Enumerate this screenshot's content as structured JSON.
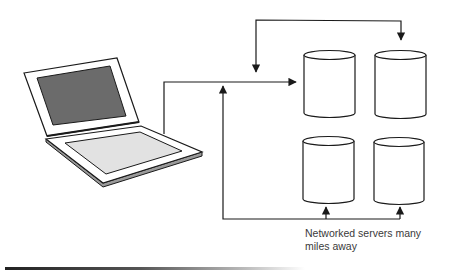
{
  "diagram": {
    "type": "network",
    "nodes": [
      {
        "id": "laptop",
        "label": "Laptop computer",
        "icon": "laptop-icon"
      },
      {
        "id": "server-1",
        "label": "Server",
        "icon": "database-cylinder-icon",
        "position": "top-left"
      },
      {
        "id": "server-2",
        "label": "Server",
        "icon": "database-cylinder-icon",
        "position": "top-right"
      },
      {
        "id": "server-3",
        "label": "Server",
        "icon": "database-cylinder-icon",
        "position": "bottom-left"
      },
      {
        "id": "server-4",
        "label": "Server",
        "icon": "database-cylinder-icon",
        "position": "bottom-right"
      }
    ],
    "connections": [
      {
        "from": "laptop",
        "to": "server-1",
        "style": "arrow"
      },
      {
        "from": "top-bus",
        "to": "laptop-line",
        "style": "arrow-down"
      },
      {
        "from": "top-bus",
        "to": "server-2",
        "style": "arrow-down"
      },
      {
        "from": "bottom-bus",
        "to": "laptop-line",
        "style": "arrow-up"
      },
      {
        "from": "bottom-bus",
        "to": "server-3",
        "style": "arrow-up"
      },
      {
        "from": "bottom-bus",
        "to": "server-4",
        "style": "arrow-up"
      }
    ],
    "caption": {
      "line1": "Networked servers many",
      "line2": "miles away"
    },
    "colors": {
      "stroke": "#1a1a1a",
      "screen": "#6b6b6b",
      "keyboard": "#e2e2e2",
      "base_side": "#9a9a9a",
      "caption_text": "#3a3a3a"
    }
  }
}
